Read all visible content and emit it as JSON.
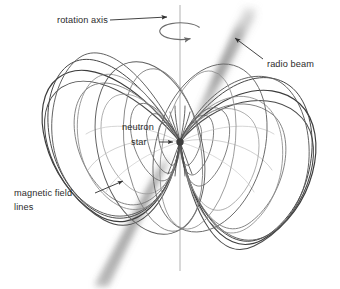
{
  "diagram": {
    "background_color": "#ffffff",
    "labels": {
      "rotation_axis": "rotation axis",
      "radio_beam": "radio beam",
      "neutron_star_line1": "neutron",
      "neutron_star_line2": "star",
      "magnetic_field_line1": "magnetic field",
      "magnetic_field_line2": "lines"
    },
    "colors": {
      "field_line_dark": "#3a3a3a",
      "field_line_mid": "#6f6f6f",
      "field_line_light": "#a8a8a8",
      "rotation_axis": "#b9b9b9",
      "radio_beam": "#9a9a9a",
      "label_text": "#2b2b2b",
      "leader_line": "#333333",
      "neutron_star": "#3d3d3d"
    },
    "elements": {
      "neutron_star": {
        "cx": 180,
        "cy": 142,
        "r": 3.6
      },
      "rotation_axis": {
        "x": 180,
        "y_top": 5,
        "y_bottom": 271
      },
      "rotation_arrow": {
        "cx": 180,
        "cy": 31,
        "rx": 21,
        "ry": 8
      },
      "radio_beam_upper": {
        "x1": 196,
        "y1": 120,
        "x2": 253,
        "y2": 12,
        "width": 13
      },
      "radio_beam_lower": {
        "x1": 164,
        "y1": 164,
        "x2": 98,
        "y2": 285,
        "width": 13
      },
      "beam_tilt_degrees": 28,
      "left_lobe_loops": 9,
      "right_lobe_loops": 9
    },
    "leaders": {
      "rotation_axis": {
        "x1": 110,
        "y1": 22,
        "x2": 168,
        "y2": 18
      },
      "radio_beam": {
        "x1": 262,
        "y1": 60,
        "x2": 233,
        "y2": 37
      },
      "neutron_star": {
        "x1": 160,
        "y1": 142,
        "x2": 174,
        "y2": 142
      },
      "magnetic_field": {
        "x1": 97,
        "y1": 192,
        "x2": 124,
        "y2": 182
      }
    }
  }
}
